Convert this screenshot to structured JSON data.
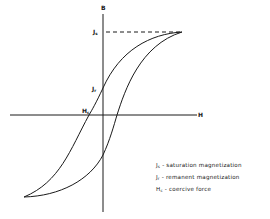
{
  "diagram": {
    "axes": {
      "vertical_label": "B",
      "horizontal_label": "H"
    },
    "markers": {
      "saturation": {
        "symbol": "J",
        "sub": "s"
      },
      "remanent": {
        "symbol": "J",
        "sub": "r"
      },
      "coercive": {
        "symbol": "H",
        "sub": "c"
      }
    },
    "legend": [
      {
        "symbol": "J",
        "sub": "s",
        "text": " - saturation magnetization"
      },
      {
        "symbol": "J",
        "sub": "r",
        "text": " - remanent magnetization"
      },
      {
        "symbol": "H",
        "sub": "c",
        "text": " - coercive force"
      }
    ],
    "colors": {
      "line": "#1a1a1a",
      "background": "#ffffff"
    }
  }
}
